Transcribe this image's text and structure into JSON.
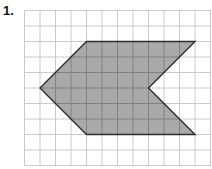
{
  "problem": {
    "label": "1."
  },
  "grid": {
    "origin_x": 24.5,
    "origin_y": 10.5,
    "cell_size": 15.5,
    "columns": 12,
    "rows": 10,
    "line_color": "#c4c4c4"
  },
  "shape": {
    "type": "chevron-polygon",
    "fill_color": "#a9a9a9",
    "stroke_color": "#2e2e2e",
    "inner_grid_color": "#7d7d7d",
    "vertices_grid_units": [
      [
        4,
        2
      ],
      [
        11,
        2
      ],
      [
        8,
        5
      ],
      [
        11,
        8
      ],
      [
        4,
        8
      ],
      [
        1,
        5
      ]
    ]
  }
}
